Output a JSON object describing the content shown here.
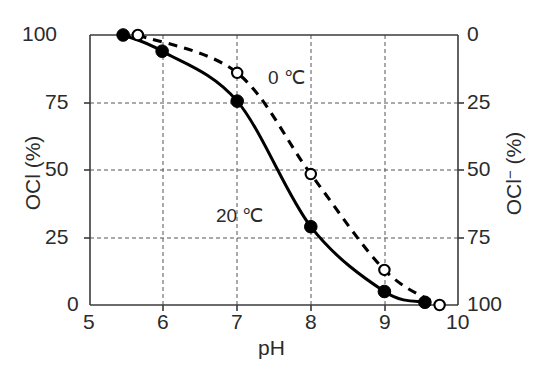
{
  "chart_data": {
    "type": "line",
    "title": "",
    "subtitle": "",
    "xlabel": "pH",
    "ylabel": "OCl (%)",
    "ylabel_right": "OCl⁻ (%)",
    "xlim": [
      5,
      10
    ],
    "ylim": [
      0,
      100
    ],
    "ylim_right": [
      100,
      0
    ],
    "xticks": [
      5,
      6,
      7,
      8,
      9,
      10
    ],
    "xtick_labels": [
      "5",
      "6",
      "7",
      "8",
      "9",
      "10"
    ],
    "yticks": [
      0,
      25,
      50,
      75,
      100
    ],
    "ytick_labels": [
      "0",
      "25",
      "50",
      "75",
      "100"
    ],
    "yticks_right": [
      0,
      25,
      50,
      75,
      100
    ],
    "ytick_labels_right": [
      "0",
      "25",
      "50",
      "75",
      "100"
    ],
    "grid": true,
    "grid_style": "dashed",
    "legend_position": "inline-annotation",
    "series": [
      {
        "name": "20 °C",
        "label": "20 ℃",
        "line_style": "solid",
        "marker": "filled-circle",
        "color": "#000000",
        "x": [
          5.45,
          5.98,
          7.0,
          8.0,
          9.0,
          9.55
        ],
        "y": [
          100,
          94,
          75.5,
          29,
          5,
          1
        ]
      },
      {
        "name": "0 °C",
        "label": "0 ℃",
        "line_style": "dashed",
        "marker": "open-circle",
        "color": "#000000",
        "x": [
          5.65,
          7.0,
          8.0,
          9.0,
          9.75
        ],
        "y": [
          100,
          86,
          48.5,
          13,
          0
        ]
      }
    ],
    "annotations": [
      {
        "text": "0 ℃",
        "x": 7.6,
        "y": 84
      },
      {
        "text": "20 ℃",
        "x": 7.0,
        "y": 40
      }
    ]
  },
  "axes": {
    "x_title": "pH",
    "left_title_main": "OCl",
    "left_title_unit": "(%)",
    "right_title_main": "OCl",
    "right_title_minus": "−",
    "right_title_unit": "(%)"
  },
  "labels": {
    "x": [
      "5",
      "6",
      "7",
      "8",
      "9",
      "10"
    ],
    "y_left": [
      "100",
      "75",
      "50",
      "25",
      "0"
    ],
    "y_right": [
      "0",
      "25",
      "50",
      "75",
      "100"
    ],
    "series_0c": "0 ℃",
    "series_20c": "20 ℃"
  }
}
